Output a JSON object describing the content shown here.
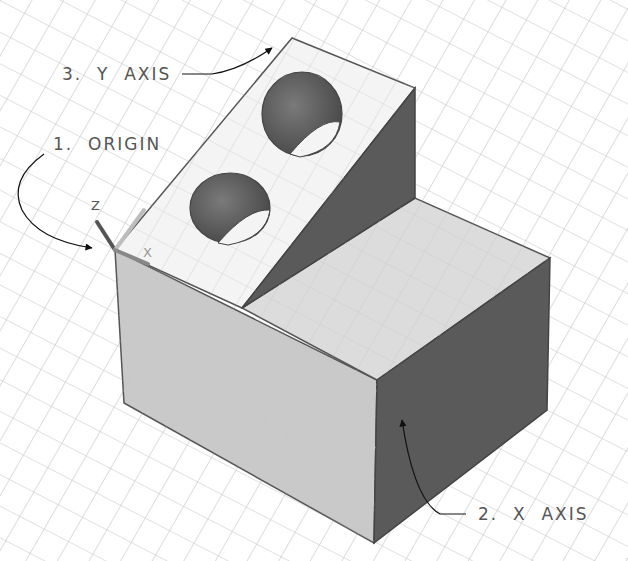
{
  "diagram": {
    "type": "isometric-cad-model",
    "labels": {
      "origin": "1.  ORIGIN",
      "x_axis": "2.  X  AXIS",
      "y_axis": "3.  Y  AXIS"
    },
    "ucs_icon": {
      "z": "Z",
      "x": "X",
      "y": "Y"
    },
    "colors": {
      "background": "#ffffff",
      "grid": "#c4c4c4",
      "face_light": "#efefef",
      "face_mid": "#c9c9c9",
      "face_dark": "#5a5a5a",
      "hole_dark": "#6a6a6a",
      "edge": "#555555",
      "text": "#555555"
    }
  }
}
